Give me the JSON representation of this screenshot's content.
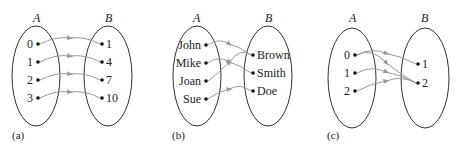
{
  "diagrams": [
    {
      "caption": "(a)",
      "set_a_label": "A",
      "set_b_label": "B",
      "domain": [
        "0",
        "1",
        "2",
        "3"
      ],
      "codomain": [
        "1",
        "4",
        "7",
        "10"
      ],
      "mapping": [
        [
          0,
          0
        ],
        [
          1,
          1
        ],
        [
          2,
          2
        ],
        [
          3,
          3
        ]
      ]
    },
    {
      "caption": "(b)",
      "set_a_label": "A",
      "set_b_label": "B",
      "domain": [
        "John",
        "Mike",
        "Joan",
        "Sue"
      ],
      "codomain": [
        "Brown",
        "Smith",
        "Doe"
      ],
      "mapping": [
        [
          0,
          0
        ],
        [
          1,
          1
        ],
        [
          2,
          0
        ],
        [
          3,
          2
        ]
      ]
    },
    {
      "caption": "(c)",
      "set_a_label": "A",
      "set_b_label": "B",
      "domain": [
        "0",
        "1",
        "2"
      ],
      "codomain": [
        "1",
        "2"
      ],
      "mapping": [
        [
          0,
          0
        ],
        [
          0,
          1
        ],
        [
          1,
          1
        ],
        [
          2,
          1
        ]
      ]
    }
  ],
  "colors": {
    "arrow": "#999999",
    "outline": "#333333",
    "dot": "#111111"
  }
}
